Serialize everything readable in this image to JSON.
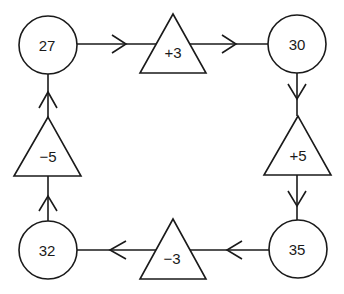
{
  "diagram": {
    "type": "cycle",
    "nodes": [
      {
        "id": "n27",
        "shape": "circle",
        "label": "27"
      },
      {
        "id": "n30",
        "shape": "circle",
        "label": "30"
      },
      {
        "id": "n35",
        "shape": "circle",
        "label": "35"
      },
      {
        "id": "n32",
        "shape": "circle",
        "label": "32"
      }
    ],
    "operations": [
      {
        "id": "op_plus3",
        "shape": "triangle",
        "label": "+3",
        "from": "n27",
        "to": "n30"
      },
      {
        "id": "op_plus5",
        "shape": "triangle",
        "label": "+5",
        "from": "n30",
        "to": "n35"
      },
      {
        "id": "op_minus3",
        "shape": "triangle",
        "label": "−3",
        "from": "n35",
        "to": "n32"
      },
      {
        "id": "op_minus5",
        "shape": "triangle",
        "label": "−5",
        "from": "n32",
        "to": "n27"
      }
    ],
    "colors": {
      "stroke": "#1a1a1a",
      "fill": "#ffffff"
    }
  }
}
